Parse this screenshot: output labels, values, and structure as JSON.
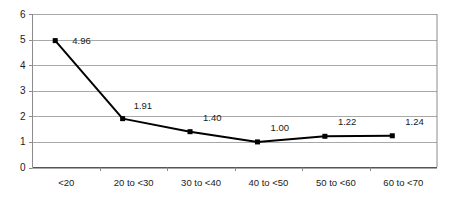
{
  "chart_data": {
    "type": "line",
    "title": "",
    "subtitle": "",
    "xlabel": "",
    "ylabel": "",
    "categories": [
      "<20",
      "20 to <30",
      "30 to <40",
      "40 to <50",
      "50 to <60",
      "60 to <70"
    ],
    "values": [
      4.96,
      1.91,
      1.4,
      1.0,
      1.22,
      1.24
    ],
    "point_labels": [
      "4.96",
      "1.91",
      "1.40",
      "1.00",
      "1.22",
      "1.24"
    ],
    "ylim": [
      0,
      6
    ],
    "ytick_labels": [
      "6",
      "5",
      "4",
      "3",
      "2",
      "1",
      "0"
    ],
    "ytick_values": [
      6,
      5,
      4,
      3,
      2,
      1,
      0
    ],
    "ystep": 1,
    "grid": true,
    "grid_axis": "y",
    "legend": false,
    "legend_position": "none",
    "marker": "square",
    "line_color": "#000000",
    "marker_color": "#000000",
    "grid_color": "#a8a8a8",
    "axis_color": "#8c8c8c",
    "background_color": "#ffffff"
  }
}
